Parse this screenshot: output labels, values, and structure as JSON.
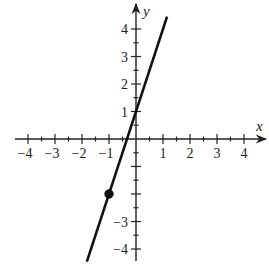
{
  "chart_data": {
    "type": "line",
    "title": "",
    "xlabel": "x",
    "ylabel": "y",
    "xlim": [
      -4.3,
      4.7
    ],
    "ylim": [
      -4.5,
      4.9
    ],
    "x_ticks": [
      -4,
      -3,
      -2,
      -1,
      1,
      2,
      3,
      4
    ],
    "y_ticks": [
      -4,
      -3,
      1,
      2,
      3,
      4
    ],
    "minor_tick_step": 0.5,
    "grid": false,
    "series": [
      {
        "name": "y = 3x + 1",
        "slope": 3,
        "intercept": 1,
        "x": [
          -1.82,
          1.15
        ],
        "y": [
          -4.46,
          4.45
        ],
        "color": "#111111"
      }
    ],
    "points": [
      {
        "x": -1,
        "y": -2,
        "filled": true,
        "color": "#111111"
      }
    ]
  },
  "colors": {
    "axis": "#222222",
    "line": "#111111",
    "background": "#ffffff"
  }
}
